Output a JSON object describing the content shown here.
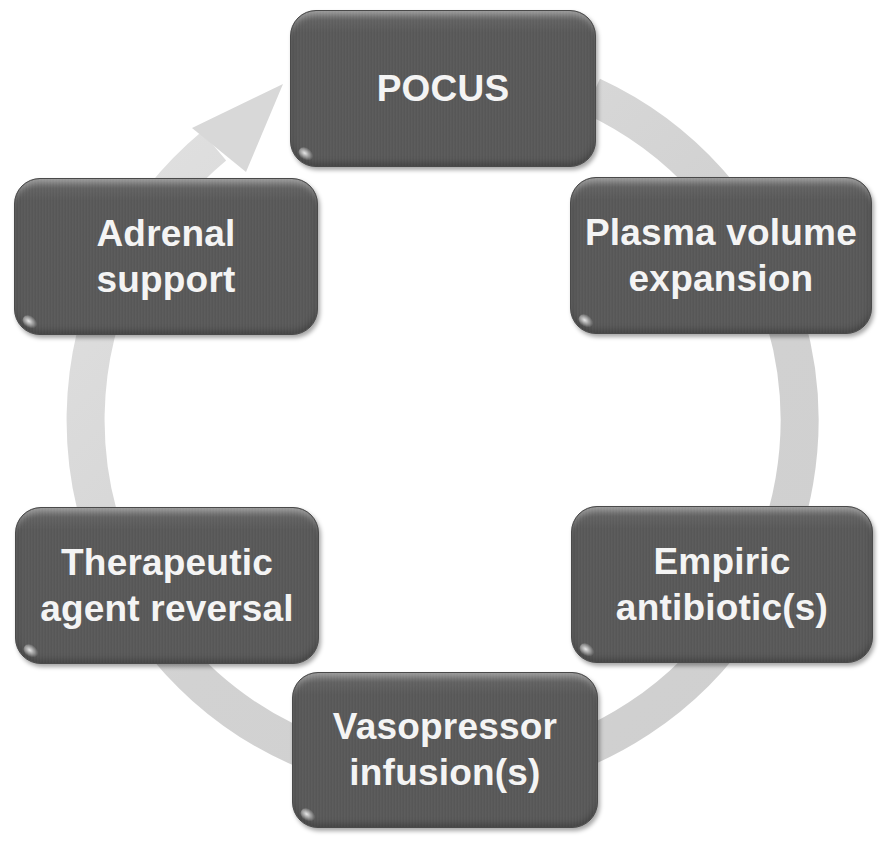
{
  "diagram": {
    "type": "cycle",
    "direction": "clockwise",
    "colors": {
      "background": "#ffffff",
      "node_fill": "#595959",
      "node_text": "#f4f4f4",
      "ring": "#d4d4d4"
    },
    "nodes": [
      {
        "id": "pocus",
        "label": "POCUS"
      },
      {
        "id": "plasma",
        "label": "Plasma volume\nexpansion"
      },
      {
        "id": "empiric",
        "label": "Empiric\nantibiotic(s)"
      },
      {
        "id": "vaso",
        "label": "Vasopressor\ninfusion(s)"
      },
      {
        "id": "thera",
        "label": "Therapeutic\nagent reversal"
      },
      {
        "id": "adrenal",
        "label": "Adrenal\nsupport"
      }
    ]
  }
}
